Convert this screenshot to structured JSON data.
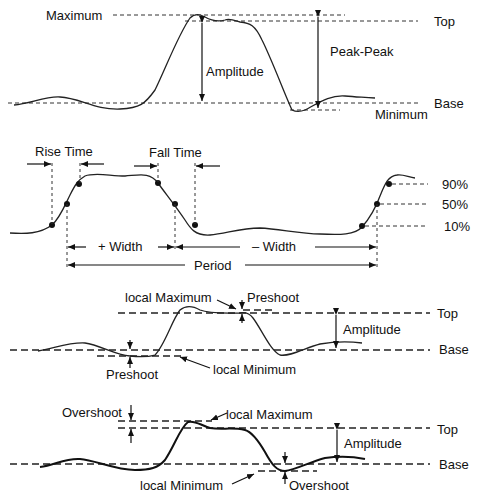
{
  "panel1": {
    "title": "Amplitude measurements",
    "labels": {
      "maximum": "Maximum",
      "amplitude": "Amplitude",
      "peak_peak": "Peak-Peak",
      "top": "Top",
      "base": "Base",
      "minimum": "Minimum"
    }
  },
  "panel2": {
    "title": "Timing measurements",
    "labels": {
      "rise_time": "Rise Time",
      "fall_time": "Fall Time",
      "plus_width": "+ Width",
      "minus_width": "– Width",
      "period": "Period",
      "p90": "90%",
      "p50": "50%",
      "p10": "10%"
    }
  },
  "panel3": {
    "title": "Preshoot measurements",
    "labels": {
      "local_maximum": "local Maximum",
      "preshoot_top": "Preshoot",
      "amplitude": "Amplitude",
      "top": "Top",
      "base": "Base",
      "preshoot_bottom": "Preshoot",
      "local_minimum": "local Minimum"
    }
  },
  "panel4": {
    "title": "Overshoot measurements",
    "labels": {
      "overshoot_top": "Overshoot",
      "local_maximum": "local Maximum",
      "amplitude": "Amplitude",
      "top": "Top",
      "base": "Base",
      "local_minimum": "local Minimum",
      "overshoot_bottom": "Overshoot"
    }
  }
}
